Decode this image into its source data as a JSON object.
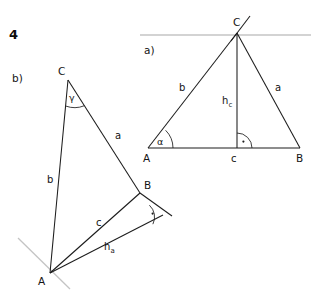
{
  "page": {
    "exercise_number": "4",
    "background_color": "#ffffff",
    "ink_color": "#1c1c1c",
    "guide_color": "#c4c4c4",
    "width": 311,
    "height": 293
  },
  "figures": [
    {
      "id": "figure-a",
      "part_label": "a)",
      "description": "acute triangle ABC with altitude h_c from C onto side c",
      "vertices": [
        {
          "name": "A",
          "label": "A",
          "x": 148,
          "y": 148
        },
        {
          "name": "B",
          "label": "B",
          "x": 300,
          "y": 148
        },
        {
          "name": "C",
          "label": "C",
          "x": 237,
          "y": 33
        }
      ],
      "sides": [
        {
          "name": "a",
          "label": "a",
          "from": "B",
          "to": "C",
          "label_x": 279,
          "label_y": 88
        },
        {
          "name": "b",
          "label": "b",
          "from": "A",
          "to": "C",
          "label_x": 182,
          "label_y": 88
        },
        {
          "name": "c",
          "label": "c",
          "from": "A",
          "to": "B",
          "label_x": 234,
          "label_y": 160
        }
      ],
      "altitude": {
        "name": "h_c",
        "label_base": "h",
        "label_sub": "c",
        "foot_x": 237,
        "foot_y": 148,
        "apex_x": 237,
        "apex_y": 33,
        "label_x": 240,
        "label_y": 103,
        "right_angle": true
      },
      "angles": [
        {
          "name": "alpha",
          "label": "α",
          "at_vertex": "A",
          "label_x": 160,
          "label_y": 142
        }
      ],
      "guide_line": {
        "name": "parallel-guide-through-C",
        "x1": 140,
        "y1": 35,
        "x2": 311,
        "y2": 35,
        "color": "#c4c4c4"
      },
      "construction_tick": {
        "name": "tick-through-C",
        "x1": 231,
        "y1": 40,
        "x2": 249,
        "y2": 17
      },
      "part_label_x": 144,
      "part_label_y": 52
    },
    {
      "id": "figure-b",
      "part_label": "b)",
      "description": "obtuse triangle ABC with altitude h_a from A onto extension of side a",
      "vertices": [
        {
          "name": "A",
          "label": "A",
          "x": 50,
          "y": 273
        },
        {
          "name": "B",
          "label": "B",
          "x": 140,
          "y": 193
        },
        {
          "name": "C",
          "label": "C",
          "x": 68,
          "y": 80
        }
      ],
      "sides": [
        {
          "name": "a",
          "label": "a",
          "from": "B",
          "to": "C",
          "label_x": 118,
          "label_y": 136
        },
        {
          "name": "b",
          "label": "b",
          "from": "A",
          "to": "C",
          "label_x": 50,
          "label_y": 180
        },
        {
          "name": "c",
          "label": "c",
          "from": "A",
          "to": "B",
          "label_x": 99,
          "label_y": 223
        }
      ],
      "altitude": {
        "name": "h_a",
        "label_base": "h",
        "label_sub": "a",
        "foot_x": 163,
        "foot_y": 215,
        "apex_x": 50,
        "apex_y": 273,
        "label_x": 108,
        "label_y": 247,
        "right_angle": true
      },
      "angles": [
        {
          "name": "gamma",
          "label": "γ",
          "at_vertex": "C",
          "label_x": 72,
          "label_y": 98
        }
      ],
      "extension": {
        "name": "side-a-extension-beyond-B",
        "x1": 140,
        "y1": 193,
        "x2": 172,
        "y2": 215
      },
      "guide_line": {
        "name": "guide-through-A",
        "x1": 18,
        "y1": 239,
        "x2": 70,
        "y2": 288,
        "color": "#c4c4c4"
      },
      "part_label_x": 14,
      "part_label_y": 80
    }
  ],
  "labels": {
    "vertex_A": "A",
    "vertex_B": "B",
    "vertex_C": "C",
    "side_a": "a",
    "side_b": "b",
    "side_c": "c",
    "altitude_h": "h",
    "sub_a": "a",
    "sub_c": "c",
    "angle_alpha": "α",
    "angle_gamma": "γ",
    "part_a": "a)",
    "part_b": "b)",
    "exercise": "4"
  }
}
